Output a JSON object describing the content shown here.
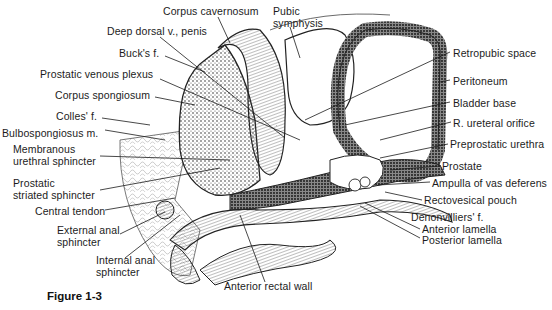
{
  "figure": {
    "caption": "Figure 1-3",
    "colors": {
      "ink": "#1a1a1a",
      "paper": "#ffffff",
      "stipple": "#555555"
    },
    "labels_left": [
      {
        "id": "corpus-cavernosum",
        "text": "Corpus cavernosum"
      },
      {
        "id": "deep-dorsal-vein",
        "text": "Deep dorsal v., penis"
      },
      {
        "id": "bucks-fascia",
        "text": "Buck's f."
      },
      {
        "id": "prostatic-venous-plexus",
        "text": "Prostatic venous plexus"
      },
      {
        "id": "corpus-spongiosum",
        "text": "Corpus spongiosum"
      },
      {
        "id": "colles-fascia",
        "text": "Colles' f."
      },
      {
        "id": "bulbospongiosus",
        "text": "Bulbospongiosus m."
      },
      {
        "id": "membranous-urethral-sphincter",
        "line1": "Membranous",
        "line2": "urethral sphincter"
      },
      {
        "id": "prostatic-striated-sphincter",
        "line1": "Prostatic",
        "line2": "striated sphincter"
      },
      {
        "id": "central-tendon",
        "text": "Central tendon"
      },
      {
        "id": "external-anal-sphincter",
        "line1": "External anal",
        "line2": "sphincter"
      },
      {
        "id": "internal-anal-sphincter",
        "line1": "Internal anal",
        "line2": "sphincter"
      }
    ],
    "labels_top": [
      {
        "id": "pubic-symphysis",
        "line1": "Pubic",
        "line2": "symphysis"
      }
    ],
    "labels_right": [
      {
        "id": "retropubic-space",
        "text": "Retropubic space"
      },
      {
        "id": "peritoneum",
        "text": "Peritoneum"
      },
      {
        "id": "bladder-base",
        "text": "Bladder base"
      },
      {
        "id": "ureteral-orifice",
        "text": "R. ureteral orifice"
      },
      {
        "id": "preprostatic-urethra",
        "text": "Preprostatic urethra"
      },
      {
        "id": "prostate",
        "text": "Prostate"
      },
      {
        "id": "ampulla-vas-deferens",
        "text": "Ampulla of vas deferens"
      },
      {
        "id": "rectovesical-pouch",
        "text": "Rectovesical pouch"
      },
      {
        "id": "denonvilliers-fascia",
        "text": "Denonvilliers' f."
      },
      {
        "id": "anterior-lamella",
        "text": "Anterior lamella"
      },
      {
        "id": "posterior-lamella",
        "text": "Posterior lamella"
      }
    ],
    "labels_bottom": [
      {
        "id": "anterior-rectal-wall",
        "text": "Anterior rectal wall"
      }
    ]
  }
}
